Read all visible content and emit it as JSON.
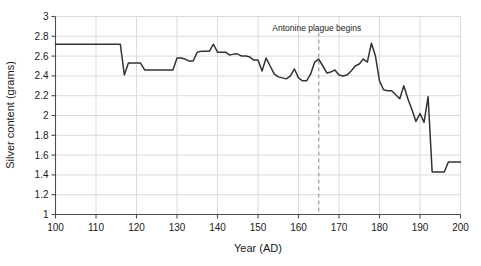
{
  "chart_data": {
    "type": "line",
    "title": "",
    "xlabel": "Year (AD)",
    "ylabel": "Silver content (grams)",
    "xlim": [
      100,
      200
    ],
    "ylim": [
      1,
      3
    ],
    "xticks": [
      100,
      110,
      120,
      130,
      140,
      150,
      160,
      170,
      180,
      190,
      200
    ],
    "yticks": [
      1,
      1.2,
      1.4,
      1.6,
      1.8,
      2,
      2.2,
      2.4,
      2.6,
      2.8,
      3
    ],
    "grid": true,
    "legend": null,
    "series": [
      {
        "name": "Silver content of the Roman denarius",
        "color": "#333333",
        "x": [
          100,
          101,
          102,
          103,
          104,
          105,
          106,
          107,
          108,
          109,
          110,
          111,
          112,
          113,
          114,
          115,
          116,
          117,
          118,
          119,
          120,
          121,
          122,
          123,
          124,
          125,
          126,
          127,
          128,
          129,
          130,
          131,
          132,
          133,
          134,
          135,
          136,
          137,
          138,
          139,
          140,
          141,
          142,
          143,
          144,
          145,
          146,
          147,
          148,
          149,
          150,
          151,
          152,
          153,
          154,
          155,
          156,
          157,
          158,
          159,
          160,
          161,
          162,
          163,
          164,
          165,
          166,
          167,
          168,
          169,
          170,
          171,
          172,
          173,
          174,
          175,
          176,
          177,
          178,
          179,
          180,
          181,
          182,
          183,
          184,
          185,
          186,
          187,
          188,
          189,
          190,
          191,
          192,
          193,
          194,
          195,
          196,
          197,
          198,
          199,
          200
        ],
        "y": [
          2.72,
          2.72,
          2.72,
          2.72,
          2.72,
          2.72,
          2.72,
          2.72,
          2.72,
          2.72,
          2.72,
          2.72,
          2.72,
          2.72,
          2.72,
          2.72,
          2.72,
          2.41,
          2.53,
          2.53,
          2.53,
          2.53,
          2.46,
          2.46,
          2.46,
          2.46,
          2.46,
          2.46,
          2.46,
          2.46,
          2.58,
          2.58,
          2.57,
          2.55,
          2.55,
          2.64,
          2.65,
          2.65,
          2.65,
          2.72,
          2.64,
          2.64,
          2.64,
          2.61,
          2.62,
          2.62,
          2.6,
          2.6,
          2.59,
          2.56,
          2.56,
          2.45,
          2.58,
          2.5,
          2.42,
          2.39,
          2.38,
          2.37,
          2.4,
          2.47,
          2.38,
          2.35,
          2.35,
          2.42,
          2.54,
          2.57,
          2.5,
          2.43,
          2.44,
          2.46,
          2.41,
          2.4,
          2.41,
          2.45,
          2.5,
          2.52,
          2.57,
          2.54,
          2.73,
          2.6,
          2.35,
          2.26,
          2.25,
          2.25,
          2.21,
          2.17,
          2.3,
          2.17,
          2.06,
          1.94,
          2.02,
          1.93,
          2.19,
          1.43,
          1.43,
          1.43,
          1.43,
          1.53,
          1.53,
          1.53,
          1.53
        ]
      }
    ],
    "annotations": [
      {
        "type": "vline",
        "x": 165,
        "label": "Antonine plague begins",
        "style": "dashed",
        "color": "#9a9a9a",
        "label_color": "#1a1a1a"
      }
    ]
  },
  "axes": {
    "x_title": "Year (AD)",
    "y_title": "Silver content (grams)",
    "x_tick_labels": [
      "100",
      "110",
      "120",
      "130",
      "140",
      "150",
      "160",
      "170",
      "180",
      "190",
      "200"
    ],
    "y_tick_labels": [
      "1",
      "1.2",
      "1.4",
      "1.6",
      "1.8",
      "2",
      "2.2",
      "2.4",
      "2.6",
      "2.8",
      "3"
    ]
  },
  "colors": {
    "line": "#333333",
    "grid": "#dcdcdc",
    "axis": "#4d4d4d",
    "text": "#1a1a1a",
    "annotation_line": "#9a9a9a",
    "background": "#ffffff"
  }
}
